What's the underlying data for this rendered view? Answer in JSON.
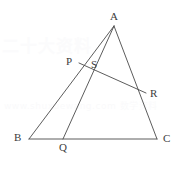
{
  "figure": {
    "kind": "geometry-diagram",
    "width": 185,
    "height": 170,
    "background_color": "#ffffff",
    "line_color": "#4a4a4a",
    "label_color": "#3c3c3c"
  },
  "points": {
    "A": {
      "label": "A",
      "x": 114,
      "y": 26,
      "label_x": 110,
      "label_y": 11
    },
    "B": {
      "label": "B",
      "x": 29,
      "y": 139,
      "label_x": 14,
      "label_y": 132
    },
    "C": {
      "label": "C",
      "x": 157,
      "y": 139,
      "label_x": 163,
      "label_y": 133
    },
    "P": {
      "label": "P",
      "x": 79,
      "y": 63,
      "label_x": 66,
      "label_y": 56
    },
    "Q": {
      "label": "Q",
      "x": 63,
      "y": 139,
      "label_x": 59,
      "label_y": 142
    },
    "R": {
      "label": "R",
      "x": 146,
      "y": 93,
      "label_x": 150,
      "label_y": 88
    },
    "S": {
      "label": "S",
      "x": 88,
      "y": 68,
      "label_x": 91,
      "label_y": 59
    }
  },
  "segments": [
    {
      "name": "side-AB",
      "from": "A",
      "to": "B"
    },
    {
      "name": "side-BC",
      "from": "B",
      "to": "C"
    },
    {
      "name": "side-CA",
      "from": "C",
      "to": "A"
    },
    {
      "name": "cevian-AQ",
      "from": "A",
      "to": "Q"
    },
    {
      "name": "segment-PR",
      "from": "P",
      "to": "R"
    }
  ],
  "watermark": {
    "top_text": "二十大资料",
    "mid_text": "www.shuxuewang.com 数学资料"
  }
}
